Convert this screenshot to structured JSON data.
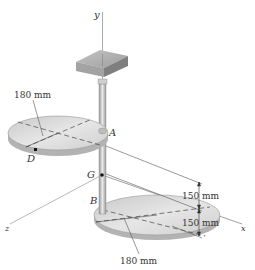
{
  "figure": {
    "axes": {
      "x": "x",
      "y": "y",
      "z": "z"
    },
    "points": {
      "A": "A",
      "B": "B",
      "D": "D",
      "G": "G"
    },
    "dimensions": {
      "upper_disk_radius": "180 mm",
      "lower_disk_radius": "180 mm",
      "upper_spacing": "150 mm",
      "lower_spacing": "150 mm"
    },
    "colors": {
      "disk_fill": "#d9d9d9",
      "disk_edge": "#b8b8b8",
      "box_top": "#b5b5b5",
      "box_side": "#8a8a8a",
      "line": "#555555"
    }
  }
}
